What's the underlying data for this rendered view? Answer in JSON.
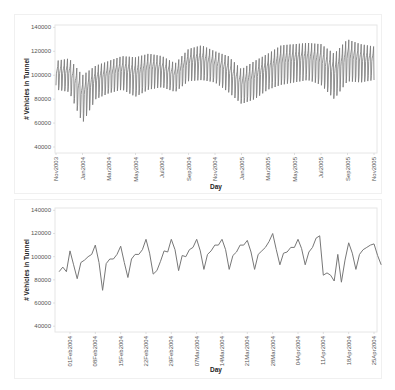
{
  "charts_meta": {
    "line_color": "#777777",
    "frame_color": "#e6e6e6",
    "panel_border_color": "#f0f0f0"
  },
  "chart_data": [
    {
      "type": "line",
      "title": "",
      "xlabel": "Day",
      "ylabel": "# Vehicles in Tunnel",
      "ylim": [
        35000,
        142000
      ],
      "yticks": [
        40000,
        60000,
        80000,
        100000,
        120000,
        140000
      ],
      "ytick_labels": [
        "40000",
        "60000",
        "80000",
        "100000",
        "120000",
        "140000"
      ],
      "xtick_labels": [
        "Nov2003",
        "Jan2004",
        "Mar2004",
        "May2004",
        "Jul2004",
        "Sep2004",
        "Nov2004",
        "Jan2005",
        "Mar2005",
        "May2005",
        "Jul2005",
        "Sep2005",
        "Nov2005"
      ],
      "grid": false,
      "description": "Daily traffic Nov2003–Nov2005, strong weekly seasonality",
      "weekly_envelope": {
        "x": [
          "Nov2003",
          "Dec2003",
          "Jan2004",
          "Feb2004",
          "Mar2004",
          "Apr2004",
          "May2004",
          "Jun2004",
          "Jul2004",
          "Aug2004",
          "Sep2004",
          "Oct2004",
          "Nov2004",
          "Dec2004",
          "Jan2005",
          "Feb2005",
          "Mar2005",
          "Apr2005",
          "May2005",
          "Jun2005",
          "Jul2005",
          "Aug2005",
          "Sep2005",
          "Oct2005",
          "Nov2005"
        ],
        "high": [
          112000,
          114000,
          100000,
          108000,
          112000,
          116000,
          115000,
          118000,
          116000,
          110000,
          122000,
          125000,
          120000,
          116000,
          105000,
          112000,
          118000,
          125000,
          126000,
          127000,
          126000,
          118000,
          130000,
          126000,
          124000
        ],
        "low": [
          88000,
          86000,
          60000,
          80000,
          85000,
          88000,
          82000,
          88000,
          90000,
          86000,
          95000,
          96000,
          94000,
          86000,
          76000,
          80000,
          88000,
          92000,
          94000,
          96000,
          92000,
          80000,
          95000,
          94000,
          96000
        ]
      }
    },
    {
      "type": "line",
      "title": "",
      "xlabel": "Day",
      "ylabel": "# Vehicles in Tunnel",
      "ylim": [
        35000,
        142000
      ],
      "yticks": [
        40000,
        60000,
        80000,
        100000,
        120000,
        140000
      ],
      "ytick_labels": [
        "40000",
        "60000",
        "80000",
        "100000",
        "120000",
        "140000"
      ],
      "xtick_labels": [
        "01Feb2004",
        "08Feb2004",
        "15Feb2004",
        "22Feb2004",
        "29Feb2004",
        "07Mar2004",
        "14Mar2004",
        "21Mar2004",
        "28Mar2004",
        "04Apr2004",
        "11Apr2004",
        "18Apr2004",
        "25Apr2004"
      ],
      "grid": false,
      "x": [
        "29Jan",
        "30Jan",
        "31Jan",
        "01Feb",
        "02Feb",
        "03Feb",
        "04Feb",
        "05Feb",
        "06Feb",
        "07Feb",
        "08Feb",
        "09Feb",
        "10Feb",
        "11Feb",
        "12Feb",
        "13Feb",
        "14Feb",
        "15Feb",
        "16Feb",
        "17Feb",
        "18Feb",
        "19Feb",
        "20Feb",
        "21Feb",
        "22Feb",
        "23Feb",
        "24Feb",
        "25Feb",
        "26Feb",
        "27Feb",
        "28Feb",
        "29Feb",
        "01Mar",
        "02Mar",
        "03Mar",
        "04Mar",
        "05Mar",
        "06Mar",
        "07Mar",
        "08Mar",
        "09Mar",
        "10Mar",
        "11Mar",
        "12Mar",
        "13Mar",
        "14Mar",
        "15Mar",
        "16Mar",
        "17Mar",
        "18Mar",
        "19Mar",
        "20Mar",
        "21Mar",
        "22Mar",
        "23Mar",
        "24Mar",
        "25Mar",
        "26Mar",
        "27Mar",
        "28Mar",
        "29Mar",
        "30Mar",
        "31Mar",
        "01Apr",
        "02Apr",
        "03Apr",
        "04Apr",
        "05Apr",
        "06Apr",
        "07Apr",
        "08Apr",
        "09Apr",
        "10Apr",
        "11Apr",
        "12Apr",
        "13Apr",
        "14Apr",
        "15Apr",
        "16Apr",
        "17Apr",
        "18Apr",
        "19Apr",
        "20Apr",
        "21Apr",
        "22Apr",
        "23Apr",
        "24Apr",
        "25Apr",
        "26Apr"
      ],
      "values": [
        87000,
        91000,
        87000,
        105000,
        93000,
        81000,
        95000,
        97000,
        100000,
        102000,
        110000,
        95000,
        71000,
        94000,
        98000,
        98000,
        102000,
        109000,
        95000,
        82000,
        98000,
        102000,
        102000,
        106000,
        115000,
        103000,
        85000,
        88000,
        96000,
        105000,
        104000,
        115000,
        106000,
        88000,
        101000,
        100000,
        106000,
        108000,
        115000,
        105000,
        89000,
        102000,
        105000,
        110000,
        110000,
        115000,
        106000,
        89000,
        101000,
        104000,
        110000,
        110000,
        114000,
        104000,
        89000,
        102000,
        105000,
        108000,
        113000,
        120000,
        106000,
        93000,
        103000,
        104000,
        108000,
        108000,
        115000,
        107000,
        93000,
        104000,
        108000,
        116000,
        118000,
        84000,
        86000,
        84000,
        79000,
        102000,
        78000,
        97000,
        112000,
        103000,
        89000,
        102000,
        106000,
        108000,
        110000,
        111000,
        101000,
        93000
      ]
    }
  ],
  "page": {
    "footer_caption": ""
  }
}
